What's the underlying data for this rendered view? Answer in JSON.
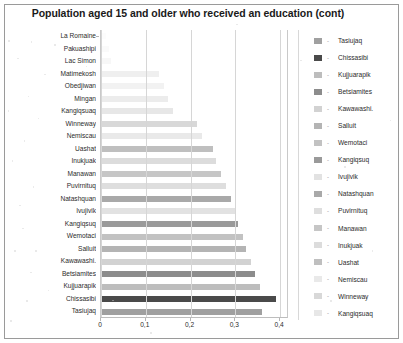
{
  "chart_data": {
    "type": "bar",
    "orientation": "horizontal",
    "title": "Population aged 15 and older who received an education (cont)",
    "xlabel": "",
    "ylabel": "",
    "xlim": [
      0,
      0.42
    ],
    "xticks": [
      0,
      0.1,
      0.2,
      0.3,
      0.4
    ],
    "xticklabels": [
      "0",
      "0,1",
      "0,2",
      "0,3",
      "0,4"
    ],
    "decimal_separator": ",",
    "grid": "vertical",
    "legend_position": "right",
    "categories": [
      "La Romaine",
      "Pakuashipi",
      "Lac Simon",
      "Matimekosh",
      "Obedjiwan",
      "Mingan",
      "Kangiqsuaq",
      "Winneway",
      "Nemiscau",
      "Uashat",
      "Inukjuak",
      "Manawan",
      "Puvirnituq",
      "Natashquan",
      "Ivujivik",
      "Kangiqsuq",
      "Wemotaci",
      "Salluit",
      "Kawawashi.",
      "Betsiamites",
      "Kujjuarapik",
      "Chissasibi",
      "Tasiujaq"
    ],
    "values": [
      0.012,
      0.018,
      0.022,
      0.13,
      0.14,
      0.15,
      0.16,
      0.215,
      0.225,
      0.25,
      0.258,
      0.268,
      0.28,
      0.29,
      0.3,
      0.305,
      0.318,
      0.325,
      0.335,
      0.345,
      0.355,
      0.392,
      0.36
    ],
    "bar_colors": [
      "#fcfcfc",
      "#fafafa",
      "#f7f7f7",
      "#efefef",
      "#f2f2f2",
      "#ececec",
      "#e7e7e7",
      "#d8d8d8",
      "#e9e9e9",
      "#bfbfbf",
      "#dcdcdc",
      "#c6c6c6",
      "#dedede",
      "#a9a9a9",
      "#e2e2e2",
      "#9a9a9a",
      "#c2c2c2",
      "#b4b4b4",
      "#d2d2d2",
      "#8c8c8c",
      "#bdbdbd",
      "#4a4a4a",
      "#a0a0a0"
    ],
    "legend_entries": [
      {
        "label": "Tasiujaq",
        "color": "#a0a0a0"
      },
      {
        "label": "Chissasibi",
        "color": "#4a4a4a"
      },
      {
        "label": "Kujjuarapik",
        "color": "#bdbdbd"
      },
      {
        "label": "Betsiamites",
        "color": "#8c8c8c"
      },
      {
        "label": "Kawawashi.",
        "color": "#d2d2d2"
      },
      {
        "label": "Salluit",
        "color": "#b4b4b4"
      },
      {
        "label": "Wemotaci",
        "color": "#c2c2c2"
      },
      {
        "label": "Kangiqsuq",
        "color": "#9a9a9a"
      },
      {
        "label": "Ivujivik",
        "color": "#e2e2e2"
      },
      {
        "label": "Natashquan",
        "color": "#a9a9a9"
      },
      {
        "label": "Puvirnituq",
        "color": "#dedede"
      },
      {
        "label": "Manawan",
        "color": "#c6c6c6"
      },
      {
        "label": "Inukjuak",
        "color": "#dcdcdc"
      },
      {
        "label": "Uashat",
        "color": "#bfbfbf"
      },
      {
        "label": "Nemiscau",
        "color": "#e9e9e9"
      },
      {
        "label": "Winneway",
        "color": "#d8d8d8"
      },
      {
        "label": "Kangiqsuaq",
        "color": "#e7e7e7"
      }
    ],
    "legend_dash": "-"
  }
}
